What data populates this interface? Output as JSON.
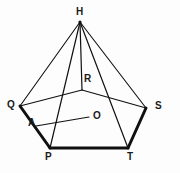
{
  "figure": {
    "background_color": "#fdfdfd",
    "stroke_color": "#101010",
    "label_color": "#1a1a1a",
    "thin_stroke_width": 1.1,
    "thick_stroke_width": 3.0,
    "canvas": {
      "width": 180,
      "height": 173
    }
  },
  "vertices": {
    "H": {
      "label": "H",
      "x": 80,
      "y": 22,
      "label_x": 76,
      "label_y": 7,
      "role": "apex"
    },
    "Q": {
      "label": "Q",
      "x": 20,
      "y": 106,
      "label_x": 8,
      "label_y": 101,
      "role": "base-vertex-left"
    },
    "R": {
      "label": "R",
      "x": 82,
      "y": 90,
      "label_x": 84,
      "label_y": 74,
      "role": "base-vertex-back"
    },
    "S": {
      "label": "S",
      "x": 146,
      "y": 108,
      "label_x": 154,
      "label_y": 102,
      "role": "base-vertex-right"
    },
    "P": {
      "label": "P",
      "x": 50,
      "y": 148,
      "label_x": 45,
      "label_y": 153,
      "role": "base-vertex-front-left"
    },
    "T": {
      "label": "T",
      "x": 128,
      "y": 148,
      "label_x": 127,
      "label_y": 153,
      "role": "base-vertex-front-right"
    },
    "O": {
      "label": "O",
      "x": 88,
      "y": 118,
      "label_x": 92,
      "label_y": 112,
      "role": "center-point"
    },
    "A": {
      "label": "A",
      "x": 38,
      "y": 125,
      "label_x": 28,
      "label_y": 119,
      "role": "edge-midpoint-on-QP"
    }
  },
  "edges": [
    {
      "name": "H-Q",
      "from": "H",
      "to": "Q",
      "weight": "thin"
    },
    {
      "name": "H-P",
      "from": "H",
      "to": "P",
      "weight": "thin"
    },
    {
      "name": "H-R",
      "from": "H",
      "to": "R",
      "weight": "thin"
    },
    {
      "name": "H-T",
      "from": "H",
      "to": "T",
      "weight": "thin"
    },
    {
      "name": "H-S",
      "from": "H",
      "to": "S",
      "weight": "thin"
    },
    {
      "name": "Q-R",
      "from": "Q",
      "to": "R",
      "weight": "thin"
    },
    {
      "name": "R-S",
      "from": "R",
      "to": "S",
      "weight": "thin"
    },
    {
      "name": "Q-P",
      "from": "Q",
      "to": "P",
      "weight": "thick"
    },
    {
      "name": "P-T",
      "from": "P",
      "to": "T",
      "weight": "thick"
    },
    {
      "name": "T-S",
      "from": "T",
      "to": "S",
      "weight": "thick"
    },
    {
      "name": "A-O",
      "from": "A",
      "to": "O",
      "weight": "thin"
    }
  ],
  "labels_order": [
    "H",
    "R",
    "Q",
    "S",
    "O",
    "A",
    "P",
    "T"
  ]
}
